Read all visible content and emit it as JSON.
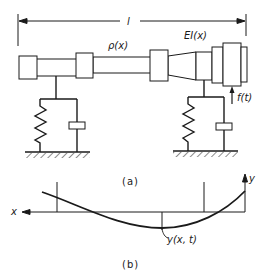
{
  "figure": {
    "dimension_label": "l",
    "mass_label": "ρ(x)",
    "stiffness_label": "EI(x)",
    "force_label": "f(t)",
    "caption_a": "(a)",
    "caption_b": "(b)",
    "x_axis_label": "x",
    "y_axis_label": "y",
    "deflection_label": "y(x, t)"
  },
  "colors": {
    "ink": "#1a1a1a",
    "background": "#ffffff"
  },
  "components": {
    "shaft": "stepped rotor shaft with tapered section",
    "supports": [
      {
        "name": "left-support",
        "elements": [
          "spring",
          "damper"
        ]
      },
      {
        "name": "right-support",
        "elements": [
          "spring",
          "damper"
        ]
      }
    ],
    "deflection_plot": "deflected beam curve y(x,t) crossing x-axis, with support and midpoint reference lines"
  }
}
